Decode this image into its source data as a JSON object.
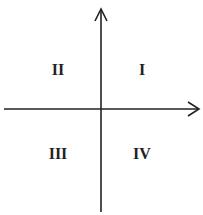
{
  "diagram": {
    "type": "cartesian-quadrants",
    "axis_color": "#222222",
    "quadrants": [
      {
        "label": "I",
        "position": "top-right"
      },
      {
        "label": "II",
        "position": "top-left"
      },
      {
        "label": "III",
        "position": "bottom-left"
      },
      {
        "label": "IV",
        "position": "bottom-right"
      }
    ]
  }
}
